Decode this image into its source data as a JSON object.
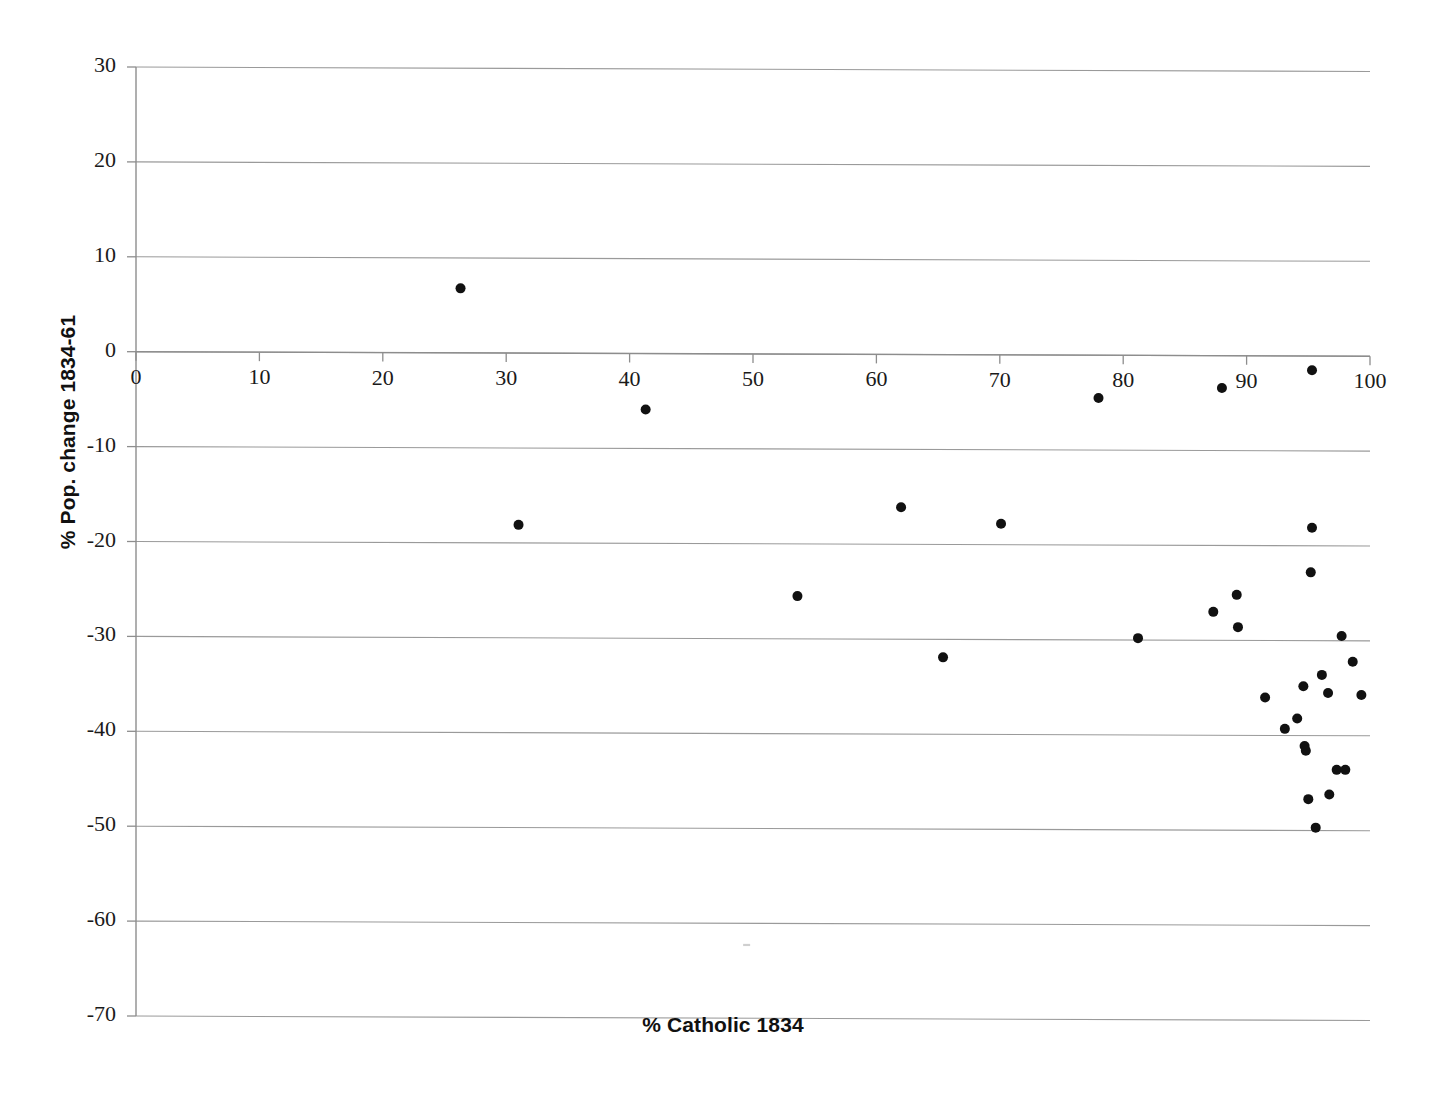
{
  "chart_data": {
    "type": "scatter",
    "title": "",
    "subtitle": "",
    "xlabel": "% Catholic 1834",
    "ylabel": "% Pop. change 1834-61",
    "xlim": [
      0,
      100
    ],
    "ylim": [
      -70,
      30
    ],
    "xticks": [
      0,
      10,
      20,
      30,
      40,
      50,
      60,
      70,
      80,
      90,
      100
    ],
    "yticks": [
      30,
      20,
      10,
      0,
      -10,
      -20,
      -30,
      -40,
      -50,
      -60,
      -70
    ],
    "xtick_labels": [
      "0",
      "10",
      "20",
      "30",
      "40",
      "50",
      "60",
      "70",
      "80",
      "90",
      "100"
    ],
    "ytick_labels": [
      "30",
      "20",
      "10",
      "0",
      "-10",
      "-20",
      "-30",
      "-40",
      "-50",
      "-60",
      "-70"
    ],
    "grid": "horizontal",
    "legend": "none",
    "marker": {
      "shape": "circle",
      "color": "#111111",
      "size": 9
    },
    "series": [
      {
        "name": "Districts",
        "points": [
          [
            26.3,
            6.8
          ],
          [
            41.3,
            -5.9
          ],
          [
            31.0,
            -18.1
          ],
          [
            53.6,
            -25.5
          ],
          [
            62.0,
            -16.1
          ],
          [
            65.4,
            -31.9
          ],
          [
            70.1,
            -17.8
          ],
          [
            78.0,
            -4.5
          ],
          [
            81.2,
            -29.8
          ],
          [
            87.3,
            -27.0
          ],
          [
            88.0,
            -3.4
          ],
          [
            89.2,
            -25.2
          ],
          [
            89.3,
            -28.6
          ],
          [
            91.5,
            -36.0
          ],
          [
            93.1,
            -39.3
          ],
          [
            94.1,
            -38.2
          ],
          [
            94.6,
            -34.8
          ],
          [
            94.7,
            -41.1
          ],
          [
            94.8,
            -41.6
          ],
          [
            95.0,
            -46.7
          ],
          [
            95.2,
            -22.8
          ],
          [
            95.3,
            -1.5
          ],
          [
            95.3,
            -18.1
          ],
          [
            95.6,
            -49.7
          ],
          [
            96.1,
            -33.6
          ],
          [
            96.6,
            -35.5
          ],
          [
            96.7,
            -46.2
          ],
          [
            97.3,
            -43.6
          ],
          [
            97.7,
            -29.5
          ],
          [
            98.0,
            -43.6
          ],
          [
            98.6,
            -32.2
          ],
          [
            99.3,
            -35.7
          ]
        ]
      }
    ]
  }
}
